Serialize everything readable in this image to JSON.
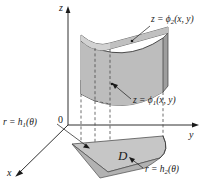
{
  "figure": {
    "background_color": "#ffffff",
    "ink_color": "#1a1a1a",
    "axes": [
      {
        "name": "z-axis",
        "label": "z",
        "direction": "up"
      },
      {
        "name": "y-axis",
        "label": "y",
        "direction": "right"
      },
      {
        "name": "x-axis",
        "label": "x",
        "direction": "lower-left"
      }
    ],
    "origin": {
      "label": "0"
    },
    "labels": {
      "upper_surface": {
        "prefix": "z = ",
        "fn": "ϕ",
        "sub": "2",
        "args": "(x, y)"
      },
      "lower_surface": {
        "prefix": "z = ",
        "fn": "ϕ",
        "sub": "1",
        "args": "(x, y)"
      },
      "inner_radius": {
        "prefix": "r = ",
        "fn": "h",
        "sub": "1",
        "args": "(θ)"
      },
      "outer_radius": {
        "prefix": "r = ",
        "fn": "h",
        "sub": "2",
        "args": "(θ)"
      },
      "region": "D"
    },
    "surfaces": {
      "upper_fill": "#c9c9c9",
      "lower_fill": "#cfcfcf",
      "front_fill": "#b9b9b9",
      "side_fill": "#a8a8a8",
      "region_fill": "#c4c4c4",
      "region_side_fill": "#b0b0b0"
    }
  }
}
